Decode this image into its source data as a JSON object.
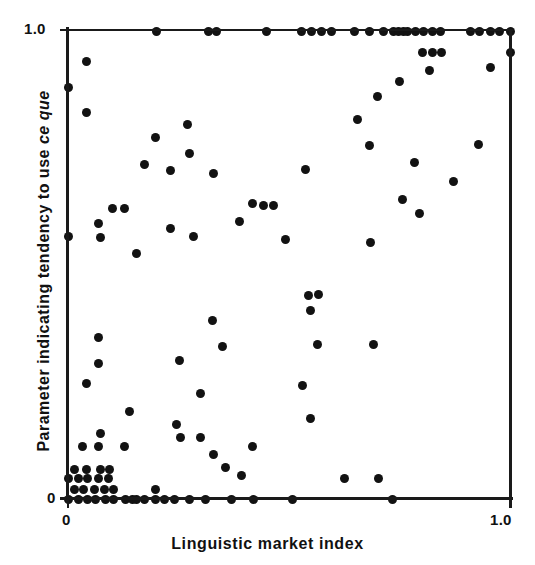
{
  "figure": {
    "background_color": "#ffffff",
    "marker_color": "#121212",
    "axis_color": "#1a1a1a"
  },
  "axes": {
    "y_tick_top": "1.0",
    "y_tick_bottom": "0",
    "x_tick_left": "0",
    "x_tick_right": "1.0",
    "x_title": "Linguistic market index",
    "y_title_part1": "Parameter indicating tendency to use ",
    "y_title_italic": "ce que"
  },
  "chart_data": {
    "type": "scatter",
    "title": "",
    "xlabel": "Linguistic market index",
    "ylabel": "Parameter indicating tendency to use ce que",
    "xlim": [
      0.0,
      1.0
    ],
    "ylim": [
      0.0,
      1.0
    ],
    "xticks": [
      0.0,
      1.0
    ],
    "yticks": [
      0.0,
      1.0
    ],
    "xticklabels": [
      "0",
      "1.0"
    ],
    "yticklabels": [
      "0",
      "1.0"
    ],
    "grid": false,
    "legend": null,
    "marker": "filled-circle",
    "marker_size_px": 9,
    "n_points": 150,
    "points": [
      [
        0.201,
        1.0
      ],
      [
        0.317,
        1.0
      ],
      [
        0.335,
        1.0
      ],
      [
        0.45,
        1.0
      ],
      [
        0.529,
        1.0
      ],
      [
        0.552,
        1.0
      ],
      [
        0.574,
        1.0
      ],
      [
        0.597,
        1.0
      ],
      [
        0.649,
        1.0
      ],
      [
        0.683,
        1.0
      ],
      [
        0.714,
        1.0
      ],
      [
        0.737,
        1.0
      ],
      [
        0.747,
        1.0
      ],
      [
        0.76,
        1.0
      ],
      [
        0.769,
        1.0
      ],
      [
        0.787,
        1.0
      ],
      [
        0.805,
        1.0
      ],
      [
        0.824,
        1.0
      ],
      [
        0.842,
        1.0
      ],
      [
        0.91,
        1.0
      ],
      [
        0.932,
        1.0
      ],
      [
        0.955,
        1.0
      ],
      [
        0.977,
        1.0
      ],
      [
        1.0,
        1.0
      ],
      [
        0.803,
        0.955
      ],
      [
        0.824,
        0.955
      ],
      [
        0.846,
        0.955
      ],
      [
        0.819,
        0.915
      ],
      [
        0.955,
        0.923
      ],
      [
        1.0,
        0.955
      ],
      [
        0.0,
        0.88
      ],
      [
        0.041,
        0.934
      ],
      [
        0.041,
        0.825
      ],
      [
        0.751,
        0.893
      ],
      [
        0.701,
        0.86
      ],
      [
        0.656,
        0.81
      ],
      [
        0.271,
        0.8
      ],
      [
        0.199,
        0.772
      ],
      [
        0.274,
        0.738
      ],
      [
        0.172,
        0.715
      ],
      [
        0.683,
        0.755
      ],
      [
        0.928,
        0.757
      ],
      [
        0.873,
        0.679
      ],
      [
        0.538,
        0.705
      ],
      [
        0.233,
        0.701
      ],
      [
        0.33,
        0.695
      ],
      [
        0.783,
        0.718
      ],
      [
        0.756,
        0.639
      ],
      [
        0.417,
        0.631
      ],
      [
        0.443,
        0.627
      ],
      [
        0.465,
        0.627
      ],
      [
        0.387,
        0.592
      ],
      [
        0.127,
        0.62
      ],
      [
        0.1,
        0.62
      ],
      [
        0.068,
        0.588
      ],
      [
        0.231,
        0.578
      ],
      [
        0.796,
        0.61
      ],
      [
        0.285,
        0.56
      ],
      [
        0.0,
        0.56
      ],
      [
        0.073,
        0.558
      ],
      [
        0.491,
        0.554
      ],
      [
        0.684,
        0.548
      ],
      [
        0.154,
        0.525
      ],
      [
        0.543,
        0.435
      ],
      [
        0.566,
        0.437
      ],
      [
        0.548,
        0.402
      ],
      [
        0.328,
        0.382
      ],
      [
        0.565,
        0.33
      ],
      [
        0.692,
        0.33
      ],
      [
        0.349,
        0.326
      ],
      [
        0.068,
        0.345
      ],
      [
        0.253,
        0.296
      ],
      [
        0.068,
        0.289
      ],
      [
        0.041,
        0.246
      ],
      [
        0.531,
        0.243
      ],
      [
        0.299,
        0.225
      ],
      [
        0.548,
        0.172
      ],
      [
        0.14,
        0.187
      ],
      [
        0.246,
        0.16
      ],
      [
        0.254,
        0.131
      ],
      [
        0.299,
        0.131
      ],
      [
        0.417,
        0.113
      ],
      [
        0.073,
        0.14
      ],
      [
        0.032,
        0.113
      ],
      [
        0.068,
        0.113
      ],
      [
        0.127,
        0.113
      ],
      [
        0.33,
        0.095
      ],
      [
        0.357,
        0.068
      ],
      [
        0.393,
        0.05
      ],
      [
        0.626,
        0.043
      ],
      [
        0.703,
        0.043
      ],
      [
        0.014,
        0.064
      ],
      [
        0.041,
        0.064
      ],
      [
        0.073,
        0.064
      ],
      [
        0.095,
        0.064
      ],
      [
        0.0,
        0.043
      ],
      [
        0.023,
        0.043
      ],
      [
        0.045,
        0.043
      ],
      [
        0.068,
        0.043
      ],
      [
        0.091,
        0.043
      ],
      [
        0.014,
        0.021
      ],
      [
        0.036,
        0.021
      ],
      [
        0.059,
        0.021
      ],
      [
        0.082,
        0.021
      ],
      [
        0.104,
        0.021
      ],
      [
        0.199,
        0.021
      ],
      [
        0.0,
        0.0
      ],
      [
        0.023,
        0.0
      ],
      [
        0.045,
        0.0
      ],
      [
        0.063,
        0.0
      ],
      [
        0.084,
        0.0
      ],
      [
        0.102,
        0.0
      ],
      [
        0.129,
        0.0
      ],
      [
        0.147,
        0.0
      ],
      [
        0.156,
        0.0
      ],
      [
        0.172,
        0.0
      ],
      [
        0.197,
        0.0
      ],
      [
        0.219,
        0.0
      ],
      [
        0.242,
        0.0
      ],
      [
        0.276,
        0.0
      ],
      [
        0.31,
        0.0
      ],
      [
        0.371,
        0.0
      ],
      [
        0.419,
        0.0
      ],
      [
        0.509,
        0.0
      ],
      [
        0.735,
        0.0
      ]
    ]
  }
}
